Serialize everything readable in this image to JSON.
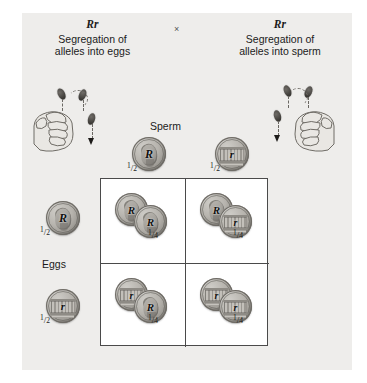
{
  "figure": {
    "background_color": "#eeedeb",
    "cross_symbol": "×"
  },
  "parents": {
    "left": {
      "genotype": "Rr",
      "caption_line1": "Segregation of",
      "caption_line2": "alleles into eggs"
    },
    "right": {
      "genotype": "Rr",
      "caption_line1": "Segregation of",
      "caption_line2": "alleles into sperm"
    }
  },
  "axes": {
    "sperm_label": "Sperm",
    "eggs_label": "Eggs"
  },
  "sperm_gametes": [
    {
      "allele": "R",
      "probability": "1/2",
      "coin_face": "heads"
    },
    {
      "allele": "r",
      "probability": "1/2",
      "coin_face": "tails"
    }
  ],
  "egg_gametes": [
    {
      "allele": "R",
      "probability": "1/2",
      "coin_face": "heads"
    },
    {
      "allele": "r",
      "probability": "1/2",
      "coin_face": "tails"
    }
  ],
  "punnett_cells": [
    {
      "egg": "R",
      "sperm": "R",
      "genotype": "RR",
      "probability": "1/4",
      "coin_back": {
        "allele": "R",
        "face": "heads"
      },
      "coin_front": {
        "allele": "R",
        "face": "heads"
      }
    },
    {
      "egg": "R",
      "sperm": "r",
      "genotype": "Rr",
      "probability": "1/4",
      "coin_back": {
        "allele": "R",
        "face": "heads"
      },
      "coin_front": {
        "allele": "r",
        "face": "tails"
      }
    },
    {
      "egg": "r",
      "sperm": "R",
      "genotype": "rR",
      "probability": "1/4",
      "coin_back": {
        "allele": "r",
        "face": "tails"
      },
      "coin_front": {
        "allele": "R",
        "face": "heads"
      }
    },
    {
      "egg": "r",
      "sperm": "r",
      "genotype": "rr",
      "probability": "1/4",
      "coin_back": {
        "allele": "r",
        "face": "tails"
      },
      "coin_front": {
        "allele": "r",
        "face": "tails"
      }
    }
  ],
  "fractions": {
    "half_numerator": "1",
    "half_slash": "/",
    "half_denominator": "2",
    "quarter_numerator": "1",
    "quarter_slash": "/",
    "quarter_denominator": "4"
  },
  "icons": {
    "left_hand": "fist-tossing-coin-icon",
    "right_hand": "fist-tossing-coin-icon",
    "arrow": "dashed-down-arrow-icon"
  }
}
